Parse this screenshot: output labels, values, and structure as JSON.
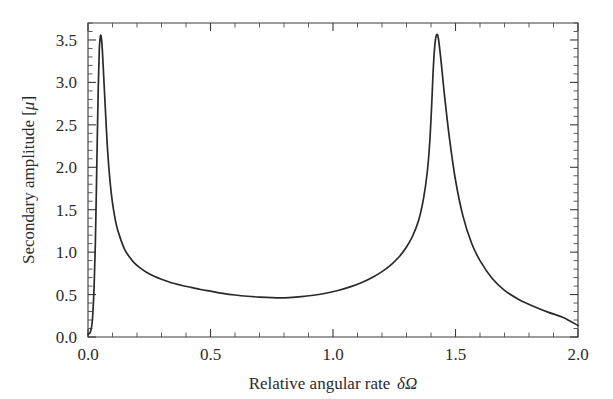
{
  "chart_data": {
    "type": "line",
    "title": "",
    "subtitle": "",
    "xlabel": "Relative angular rate δΩ",
    "ylabel": "Secondary amplitude [μ]",
    "xlim": [
      0.0,
      2.0
    ],
    "ylim": [
      0.0,
      3.7
    ],
    "grid": false,
    "legend": null,
    "legend_position": "none",
    "xticks": [
      0.0,
      0.5,
      1.0,
      1.5,
      2.0
    ],
    "xtick_labels": [
      "0.0",
      "0.5",
      "1.0",
      "1.5",
      "2.0"
    ],
    "yticks": [
      0.0,
      0.5,
      1.0,
      1.5,
      2.0,
      2.5,
      3.0,
      3.5
    ],
    "ytick_labels": [
      "0.0",
      "0.5",
      "1.0",
      "1.5",
      "2.0",
      "2.5",
      "3.0",
      "3.5"
    ],
    "x_minor_tick_step": 0.1,
    "y_minor_tick_step": 0.1,
    "series": [
      {
        "name": "secondary amplitude",
        "color": "#2a2a2a",
        "x": [
          0.0,
          0.01,
          0.018,
          0.025,
          0.03,
          0.034,
          0.038,
          0.042,
          0.046,
          0.05,
          0.053,
          0.057,
          0.061,
          0.066,
          0.072,
          0.08,
          0.09,
          0.1,
          0.115,
          0.13,
          0.15,
          0.17,
          0.19,
          0.21,
          0.24,
          0.27,
          0.3,
          0.34,
          0.38,
          0.42,
          0.46,
          0.5,
          0.55,
          0.6,
          0.65,
          0.7,
          0.75,
          0.78,
          0.82,
          0.87,
          0.92,
          0.97,
          1.02,
          1.07,
          1.12,
          1.16,
          1.2,
          1.24,
          1.27,
          1.3,
          1.325,
          1.35,
          1.37,
          1.385,
          1.395,
          1.403,
          1.41,
          1.418,
          1.428,
          1.44,
          1.455,
          1.475,
          1.5,
          1.53,
          1.565,
          1.6,
          1.65,
          1.7,
          1.76,
          1.82,
          1.88,
          1.94,
          2.0
        ],
        "y": [
          0.03,
          0.06,
          0.2,
          0.6,
          1.1,
          1.7,
          2.35,
          2.95,
          3.38,
          3.53,
          3.55,
          3.45,
          3.25,
          2.96,
          2.62,
          2.2,
          1.83,
          1.58,
          1.33,
          1.18,
          1.03,
          0.94,
          0.87,
          0.82,
          0.76,
          0.715,
          0.68,
          0.64,
          0.61,
          0.585,
          0.56,
          0.54,
          0.515,
          0.495,
          0.48,
          0.47,
          0.463,
          0.462,
          0.465,
          0.475,
          0.492,
          0.515,
          0.548,
          0.59,
          0.645,
          0.7,
          0.77,
          0.86,
          0.945,
          1.06,
          1.19,
          1.38,
          1.64,
          1.95,
          2.3,
          2.75,
          3.2,
          3.5,
          3.55,
          3.28,
          2.85,
          2.35,
          1.85,
          1.43,
          1.11,
          0.9,
          0.69,
          0.55,
          0.44,
          0.36,
          0.29,
          0.23,
          0.135
        ]
      }
    ]
  },
  "axes": {
    "x_title_prefix": "Relative angular rate",
    "x_title_symbol": "δΩ",
    "y_title_prefix": "Secondary amplitude [",
    "y_title_symbol": "μ",
    "y_title_suffix": "]"
  }
}
